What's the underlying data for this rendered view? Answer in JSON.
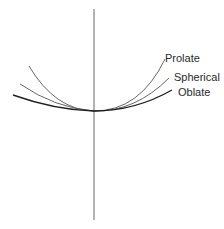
{
  "diagram": {
    "type": "curve-comparison",
    "labels": {
      "prolate": "Prolate",
      "spherical": "Spherical",
      "oblate": "Oblate"
    },
    "colors": {
      "axis": "#555555",
      "curve": "#333333",
      "text": "#2a2a2a"
    }
  }
}
